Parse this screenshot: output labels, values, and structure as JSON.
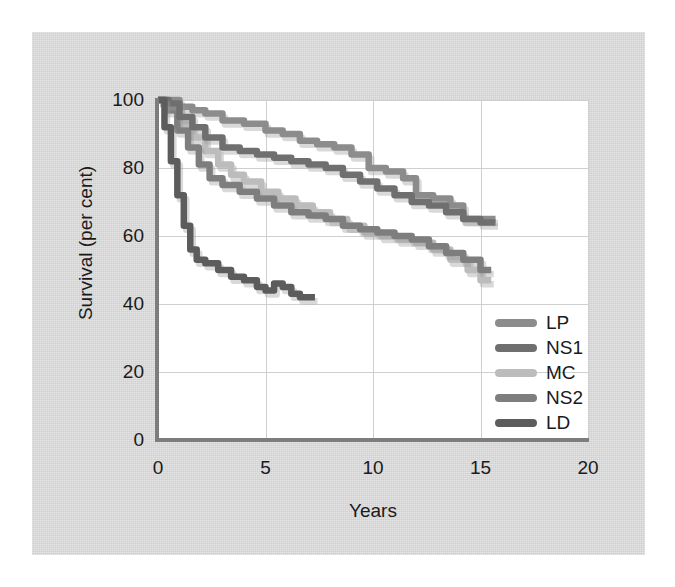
{
  "figure": {
    "panel_color": "#d4d4d4",
    "plot_background": "#ffffff",
    "axis_color": "#7d7d7d",
    "grid_color": "#cfcfcf"
  },
  "axes": {
    "x_title": "Years",
    "y_title": "Survival (per cent)",
    "x_ticks": [
      "0",
      "5",
      "10",
      "15",
      "20"
    ],
    "y_ticks": [
      "0",
      "20",
      "40",
      "60",
      "80",
      "100"
    ]
  },
  "legend": {
    "items": [
      {
        "label": "LP",
        "color": "#8c8c8c"
      },
      {
        "label": "NS1",
        "color": "#6f6f6f"
      },
      {
        "label": "MC",
        "color": "#bcbcbc"
      },
      {
        "label": "NS2",
        "color": "#7e7e7e"
      },
      {
        "label": "LD",
        "color": "#5c5c5c"
      }
    ]
  },
  "chart_data": {
    "type": "line",
    "title": "",
    "subtitle": "",
    "xlabel": "Years",
    "ylabel": "Survival (per cent)",
    "xlim": [
      0,
      20
    ],
    "ylim": [
      0,
      100
    ],
    "xticks": [
      0,
      5,
      10,
      15,
      20
    ],
    "yticks": [
      0,
      20,
      40,
      60,
      80,
      100
    ],
    "grid": true,
    "legend_position": "lower-right",
    "series": [
      {
        "name": "LP",
        "color": "#8c8c8c",
        "points": [
          [
            0.0,
            100
          ],
          [
            0.6,
            100
          ],
          [
            1.0,
            98
          ],
          [
            1.6,
            97
          ],
          [
            2.2,
            96
          ],
          [
            3.0,
            94
          ],
          [
            4.0,
            93
          ],
          [
            5.0,
            91
          ],
          [
            5.8,
            90
          ],
          [
            6.6,
            88
          ],
          [
            7.4,
            87
          ],
          [
            8.2,
            86
          ],
          [
            9.0,
            84
          ],
          [
            9.8,
            80
          ],
          [
            10.6,
            79
          ],
          [
            11.4,
            77
          ],
          [
            12.0,
            72
          ],
          [
            12.8,
            71
          ],
          [
            13.6,
            69
          ],
          [
            14.2,
            65
          ],
          [
            15.0,
            65
          ],
          [
            15.7,
            65
          ]
        ]
      },
      {
        "name": "NS1",
        "color": "#6f6f6f",
        "points": [
          [
            0.0,
            100
          ],
          [
            0.5,
            99
          ],
          [
            1.0,
            95
          ],
          [
            1.6,
            92
          ],
          [
            2.2,
            89
          ],
          [
            3.0,
            86
          ],
          [
            3.8,
            85
          ],
          [
            4.6,
            84
          ],
          [
            5.4,
            83
          ],
          [
            6.2,
            82
          ],
          [
            7.0,
            81
          ],
          [
            7.8,
            80
          ],
          [
            8.6,
            78
          ],
          [
            9.4,
            76
          ],
          [
            10.2,
            74
          ],
          [
            11.0,
            72
          ],
          [
            11.8,
            70
          ],
          [
            12.6,
            69
          ],
          [
            13.4,
            67
          ],
          [
            14.2,
            65
          ],
          [
            15.0,
            64
          ],
          [
            15.7,
            64
          ]
        ]
      },
      {
        "name": "MC",
        "color": "#bcbcbc",
        "points": [
          [
            0.0,
            100
          ],
          [
            0.4,
            98
          ],
          [
            1.0,
            93
          ],
          [
            1.6,
            89
          ],
          [
            2.2,
            85
          ],
          [
            2.8,
            81
          ],
          [
            3.4,
            78
          ],
          [
            4.0,
            76
          ],
          [
            4.8,
            73
          ],
          [
            5.6,
            71
          ],
          [
            6.4,
            69
          ],
          [
            7.2,
            67
          ],
          [
            8.0,
            65
          ],
          [
            8.8,
            63
          ],
          [
            9.6,
            61
          ],
          [
            10.4,
            60
          ],
          [
            11.2,
            59
          ],
          [
            12.0,
            58
          ],
          [
            12.8,
            56
          ],
          [
            13.6,
            53
          ],
          [
            14.4,
            50
          ],
          [
            15.0,
            47
          ],
          [
            15.5,
            47
          ]
        ]
      },
      {
        "name": "NS2",
        "color": "#7e7e7e",
        "points": [
          [
            0.0,
            100
          ],
          [
            0.4,
            97
          ],
          [
            0.9,
            91
          ],
          [
            1.4,
            86
          ],
          [
            1.9,
            81
          ],
          [
            2.4,
            77
          ],
          [
            3.0,
            75
          ],
          [
            3.8,
            73
          ],
          [
            4.6,
            71
          ],
          [
            5.4,
            69
          ],
          [
            6.2,
            67
          ],
          [
            7.0,
            66
          ],
          [
            7.8,
            65
          ],
          [
            8.6,
            63
          ],
          [
            9.4,
            62
          ],
          [
            10.2,
            61
          ],
          [
            11.0,
            60
          ],
          [
            11.8,
            59
          ],
          [
            12.6,
            57
          ],
          [
            13.4,
            55
          ],
          [
            14.2,
            53
          ],
          [
            15.0,
            50
          ],
          [
            15.5,
            50
          ]
        ]
      },
      {
        "name": "LD",
        "color": "#5c5c5c",
        "points": [
          [
            0.0,
            100
          ],
          [
            0.3,
            92
          ],
          [
            0.6,
            82
          ],
          [
            0.9,
            72
          ],
          [
            1.2,
            63
          ],
          [
            1.5,
            56
          ],
          [
            1.8,
            53
          ],
          [
            2.2,
            52
          ],
          [
            2.8,
            50
          ],
          [
            3.4,
            48
          ],
          [
            4.0,
            47
          ],
          [
            4.6,
            45
          ],
          [
            5.0,
            44
          ],
          [
            5.4,
            46
          ],
          [
            5.8,
            45
          ],
          [
            6.2,
            43
          ],
          [
            6.6,
            42
          ],
          [
            7.0,
            42
          ],
          [
            7.3,
            42
          ]
        ]
      }
    ]
  }
}
